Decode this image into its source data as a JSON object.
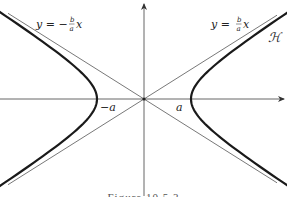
{
  "figure": {
    "caption": "Figure 10.5.3",
    "curve_label": "ℋ",
    "asymptote_pos_label": {
      "lhs": "y = ",
      "num": "b",
      "den": "a",
      "var": "x"
    },
    "asymptote_neg_label": {
      "lhs": "y = −",
      "num": "b",
      "den": "a",
      "var": "x"
    },
    "vertex_left_label": "−a",
    "vertex_right_label": "a",
    "colors": {
      "curve": "#1a1a1a",
      "asymptote": "#555555",
      "axis": "#555555"
    }
  },
  "geometry": {
    "origin_px": [
      144,
      99
    ],
    "a_px": 47,
    "b_px": 30,
    "asymptote_slope": 0.63
  }
}
